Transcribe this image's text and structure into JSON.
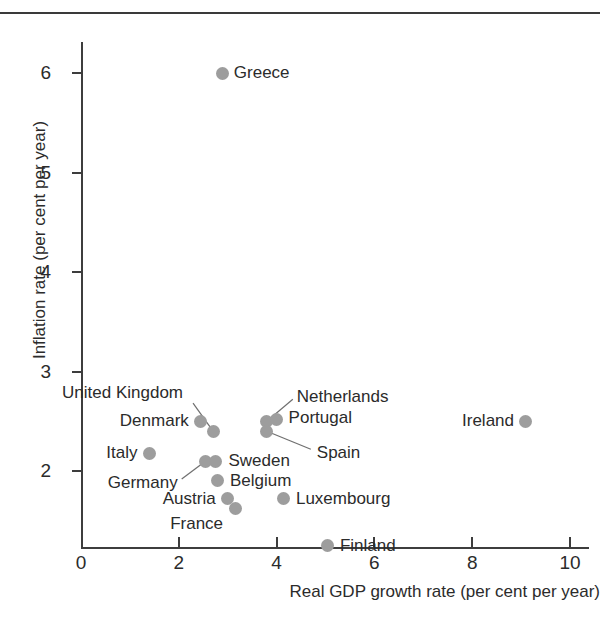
{
  "chart_data": {
    "type": "scatter",
    "title": "",
    "xlabel": "Real GDP growth rate (per cent per year)",
    "ylabel": "Inflation rate (per cent per year)",
    "xlim": [
      0,
      10.4
    ],
    "ylim": [
      1.0,
      6.45
    ],
    "xticks": [
      "0",
      "2",
      "4",
      "6",
      "8",
      "10"
    ],
    "xtick_values": [
      0,
      2,
      4,
      6,
      8,
      10
    ],
    "yticks": [
      "2",
      "3",
      "4",
      "5",
      "6"
    ],
    "ytick_values": [
      2,
      3,
      4,
      5,
      6
    ],
    "grid": false,
    "legend": "none",
    "marker_color": "#9d9d9d",
    "axis_color": "#3d3d3d",
    "text_color": "#2b2b2b",
    "points": [
      {
        "name": "Greece",
        "x": 2.9,
        "y": 6.0,
        "label_side": "right",
        "leader": false
      },
      {
        "name": "Ireland",
        "x": 9.1,
        "y": 2.5,
        "label_side": "left",
        "leader": false
      },
      {
        "name": "Denmark",
        "x": 2.45,
        "y": 2.5,
        "label_side": "left",
        "leader": false
      },
      {
        "name": "United Kingdom",
        "x": 2.7,
        "y": 2.4,
        "label_side": "left",
        "leader": true
      },
      {
        "name": "Netherlands",
        "x": 3.8,
        "y": 2.5,
        "label_side": "right",
        "leader": true
      },
      {
        "name": "Portugal",
        "x": 4.0,
        "y": 2.52,
        "label_side": "right",
        "leader": false
      },
      {
        "name": "Spain",
        "x": 3.8,
        "y": 2.4,
        "label_side": "right",
        "leader": true
      },
      {
        "name": "Italy",
        "x": 1.4,
        "y": 2.18,
        "label_side": "left",
        "leader": false
      },
      {
        "name": "Germany",
        "x": 2.55,
        "y": 2.1,
        "label_side": "left",
        "leader": true
      },
      {
        "name": "Sweden",
        "x": 2.75,
        "y": 2.1,
        "label_side": "right",
        "leader": false
      },
      {
        "name": "Belgium",
        "x": 2.8,
        "y": 1.9,
        "label_side": "right",
        "leader": false
      },
      {
        "name": "Austria",
        "x": 3.0,
        "y": 1.72,
        "label_side": "left",
        "leader": false
      },
      {
        "name": "France",
        "x": 3.15,
        "y": 1.62,
        "label_side": "left",
        "leader": false
      },
      {
        "name": "Luxembourg",
        "x": 4.15,
        "y": 1.72,
        "label_side": "right",
        "leader": false
      },
      {
        "name": "Finland",
        "x": 5.05,
        "y": 1.25,
        "label_side": "right",
        "leader": false
      }
    ]
  },
  "figure": {
    "axis_title_x": "Real GDP growth rate (per cent per year)",
    "axis_title_y": "Inflation rate (per cent per year)",
    "caption_ghost": ""
  }
}
